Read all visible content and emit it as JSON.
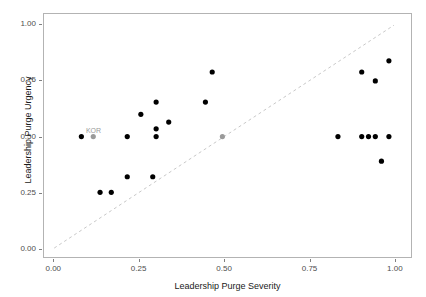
{
  "chart_data": {
    "type": "scatter",
    "title": "",
    "xlabel": "Leadership Purge Severity",
    "ylabel": "Leadership Purge Urgency",
    "xlim": [
      -0.03,
      1.05
    ],
    "ylim": [
      -0.04,
      1.05
    ],
    "xticks": [
      0.0,
      0.25,
      0.5,
      0.75,
      1.0
    ],
    "xticklabels": [
      "0.00",
      "0.25",
      "0.50",
      "0.75",
      "1.00"
    ],
    "yticks": [
      0.0,
      0.25,
      0.5,
      0.75,
      1.0
    ],
    "yticklabels": [
      "0.00",
      "0.25",
      "0.50",
      "0.75",
      "1.00"
    ],
    "grid": false,
    "legend": null,
    "point_color": "#000000",
    "highlight_color": "#9a9a9a",
    "reference_line": {
      "type": "dashed-diagonal",
      "from": [
        0.0,
        0.0
      ],
      "to": [
        1.0,
        1.0
      ],
      "color": "#c8c8c8",
      "style": "dashed"
    },
    "points": [
      {
        "x": 0.08,
        "y": 0.5,
        "color": "#000000",
        "label": null
      },
      {
        "x": 0.115,
        "y": 0.5,
        "color": "#9a9a9a",
        "label": "KOR"
      },
      {
        "x": 0.135,
        "y": 0.25,
        "color": "#000000",
        "label": null
      },
      {
        "x": 0.168,
        "y": 0.25,
        "color": "#000000",
        "label": null
      },
      {
        "x": 0.215,
        "y": 0.32,
        "color": "#000000",
        "label": null
      },
      {
        "x": 0.215,
        "y": 0.5,
        "color": "#000000",
        "label": null
      },
      {
        "x": 0.29,
        "y": 0.32,
        "color": "#000000",
        "label": null
      },
      {
        "x": 0.255,
        "y": 0.6,
        "color": "#000000",
        "label": null
      },
      {
        "x": 0.3,
        "y": 0.5,
        "color": "#000000",
        "label": null
      },
      {
        "x": 0.3,
        "y": 0.535,
        "color": "#000000",
        "label": null
      },
      {
        "x": 0.337,
        "y": 0.565,
        "color": "#000000",
        "label": null
      },
      {
        "x": 0.3,
        "y": 0.655,
        "color": "#000000",
        "label": null
      },
      {
        "x": 0.445,
        "y": 0.655,
        "color": "#000000",
        "label": null
      },
      {
        "x": 0.465,
        "y": 0.79,
        "color": "#000000",
        "label": null
      },
      {
        "x": 0.495,
        "y": 0.5,
        "color": "#9a9a9a",
        "label": null
      },
      {
        "x": 0.835,
        "y": 0.5,
        "color": "#000000",
        "label": null
      },
      {
        "x": 0.905,
        "y": 0.5,
        "color": "#000000",
        "label": null
      },
      {
        "x": 0.925,
        "y": 0.5,
        "color": "#000000",
        "label": null
      },
      {
        "x": 0.945,
        "y": 0.5,
        "color": "#000000",
        "label": null
      },
      {
        "x": 0.985,
        "y": 0.5,
        "color": "#000000",
        "label": null
      },
      {
        "x": 0.963,
        "y": 0.39,
        "color": "#000000",
        "label": null
      },
      {
        "x": 0.945,
        "y": 0.75,
        "color": "#000000",
        "label": null
      },
      {
        "x": 0.905,
        "y": 0.79,
        "color": "#000000",
        "label": null
      },
      {
        "x": 0.985,
        "y": 0.84,
        "color": "#000000",
        "label": null
      }
    ]
  }
}
